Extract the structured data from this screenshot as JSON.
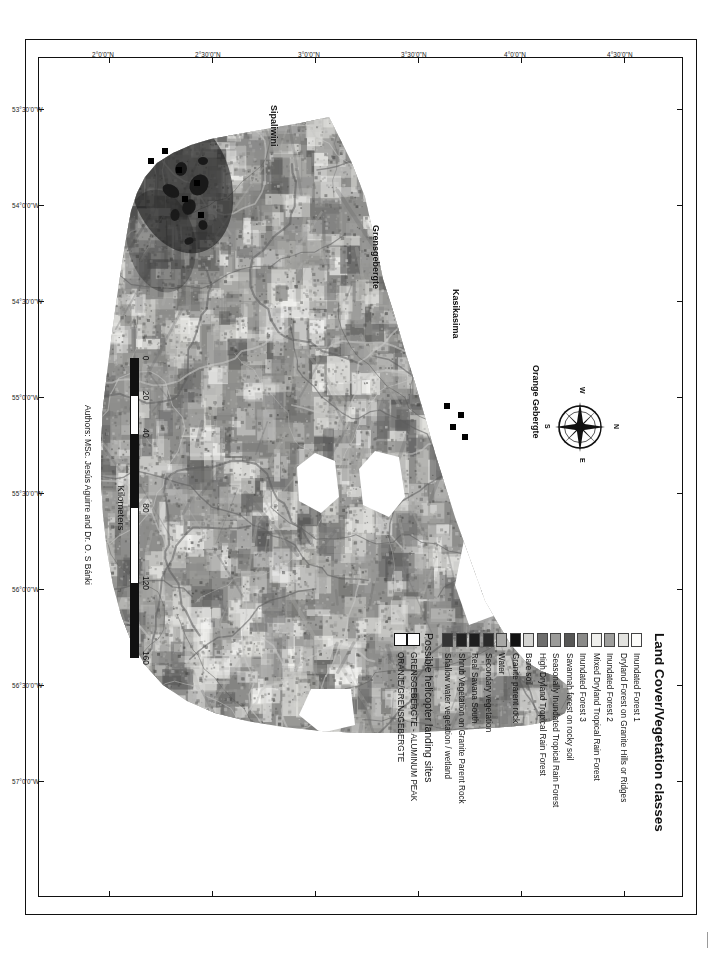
{
  "map": {
    "title": "Land Cover/Vegetation classes for Southern Suriname",
    "authors": "Authors: MSc. Jesús Aguirre and Dr. O. S Bánki",
    "compass": {
      "north": "N",
      "east": "E",
      "south": "S",
      "west": "W"
    },
    "place_labels": [
      {
        "name": "Orange Gebergte"
      },
      {
        "name": "Kasikasima"
      },
      {
        "name": "Grensgebergte"
      },
      {
        "name": "Sipaliwini"
      }
    ],
    "longitude_ticks": [
      "53°30'0\"W",
      "54°0'0\"W",
      "54°30'0\"W",
      "55°0'0\"W",
      "55°30'0\"W",
      "56°0'0\"W",
      "56°30'0\"W",
      "57°0'0\"W"
    ],
    "latitude_ticks": [
      "4°30'0\"N",
      "4°0'0\"N",
      "3°30'0\"N",
      "3°0'0\"N",
      "2°30'0\"N",
      "2°0'0\"N"
    ]
  },
  "scalebar": {
    "units": "Kilometers",
    "ticks": [
      "0",
      "20",
      "40",
      "80",
      "120",
      "160"
    ],
    "tick_positions_pct": [
      0,
      12.5,
      25,
      50,
      75,
      100
    ]
  },
  "legend": {
    "title": "Land Cover/Vegetation classes",
    "classes": [
      {
        "label": "Inundated Forest 1",
        "color": "#fdfdfb"
      },
      {
        "label": "Dryland Forest on Granite Hills or Ridges",
        "color": "#e3e3e0"
      },
      {
        "label": "Inundated Forest 2",
        "color": "#9e9e9c"
      },
      {
        "label": "Mixed Dryland Tropical Rain Forest",
        "color": "#efefec"
      },
      {
        "label": "Inundated Forest 3",
        "color": "#8b8b89"
      },
      {
        "label": "Savannah forest on rocky soil",
        "color": "#575756"
      },
      {
        "label": "Seasonally Inundated Tropical Rain Forest",
        "color": "#9b9b99"
      },
      {
        "label": "High Dryland Tropical Rain Forest",
        "color": "#6f6f6e"
      },
      {
        "label": "Bare soil",
        "color": "#d5d5d2"
      },
      {
        "label": "Granite parent rock",
        "color": "#121212"
      },
      {
        "label": "Water",
        "color": "#a7a7a5"
      },
      {
        "label": "Secondary vegetation",
        "color": "#2a2a2a"
      },
      {
        "label": "Real Savana South",
        "color": "#1e1e1e"
      },
      {
        "label": "Shrub Vegetation on Granite Parent Rock",
        "color": "#232323"
      },
      {
        "label": "Shallow water vegetation / wetland",
        "color": "#343434"
      }
    ],
    "sites_title": "Possible helicopter landing sites",
    "sites": [
      {
        "label": "GRENSGEBERGTE - ALUMINUM PEAK"
      },
      {
        "label": "ORANJE/GRENSGEBERGTE"
      }
    ]
  }
}
